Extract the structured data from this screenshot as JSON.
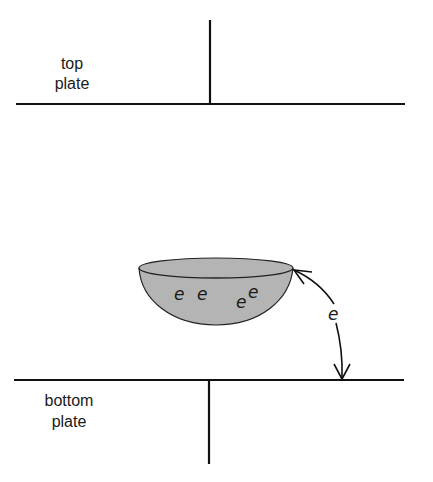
{
  "diagram": {
    "top_plate": {
      "label_line1": "top",
      "label_line2": "plate"
    },
    "bottom_plate": {
      "label_line1": "bottom",
      "label_line2": "plate"
    },
    "droplet": {
      "charges": [
        "e",
        "e",
        "e",
        "e"
      ],
      "fill_color": "#b4b4b4"
    },
    "arrow": {
      "label": "e"
    },
    "line_color": "#111111"
  }
}
